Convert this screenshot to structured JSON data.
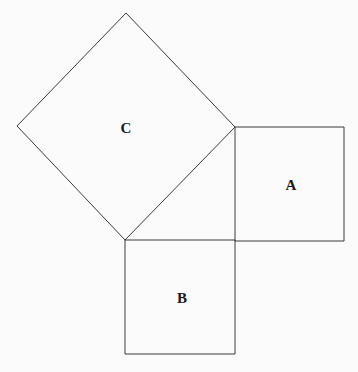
{
  "diagram": {
    "type": "pythagorean-squares",
    "stroke_color": "#3a3a3a",
    "background": "#fbfbfb",
    "squares": [
      {
        "id": "C",
        "label": "C",
        "points": "126,13 235,127 125,240 17,126",
        "label_pos": [
          126,
          133
        ]
      },
      {
        "id": "A",
        "label": "A",
        "points": "235,127 344,127 344,241 235,241",
        "label_pos": [
          291,
          190
        ]
      },
      {
        "id": "B",
        "label": "B",
        "points": "125,240 235,240 235,354 125,354",
        "label_pos": [
          182,
          303
        ]
      }
    ]
  }
}
